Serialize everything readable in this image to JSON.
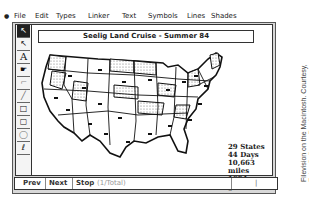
{
  "menubar": {
    "apple": "●",
    "items": [
      "File",
      "Edit",
      "Types",
      "Linker",
      "Text",
      "Symbols",
      "Lines",
      "Shades"
    ]
  },
  "toolbox": {
    "tools": [
      {
        "name": "pointer-tool",
        "glyph": "↖",
        "selected": true
      },
      {
        "name": "arrow-tool",
        "glyph": "↖",
        "selected": false
      },
      {
        "name": "text-tool",
        "glyph": "A",
        "selected": false
      },
      {
        "name": "pointing-hand-tool",
        "glyph": "☛",
        "selected": false
      },
      {
        "name": "orthogonal-line-tool",
        "glyph": "⌐",
        "selected": false
      },
      {
        "name": "line-tool",
        "glyph": "╱",
        "selected": false
      },
      {
        "name": "rectangle-tool",
        "glyph": "□",
        "selected": false
      },
      {
        "name": "rounded-rectangle-tool",
        "glyph": "▢",
        "selected": false
      },
      {
        "name": "oval-tool",
        "glyph": "◯",
        "selected": false
      },
      {
        "name": "freehand-tool",
        "glyph": "ℓ",
        "selected": false
      }
    ]
  },
  "document": {
    "title": "Seelig Land Cruise - Summer 84",
    "stats": [
      "29 States",
      "44 Days",
      "10,663 miles",
      "1694 gallons"
    ]
  },
  "statusbar": {
    "prev_label": "Prev",
    "next_label": "Next",
    "stop_label": "Stop",
    "stop_info": "(1/Total)",
    "indicator": "|"
  },
  "credit": {
    "text": "Filevision on the Macintosh. Courtesy,\nTelos Software Products"
  }
}
